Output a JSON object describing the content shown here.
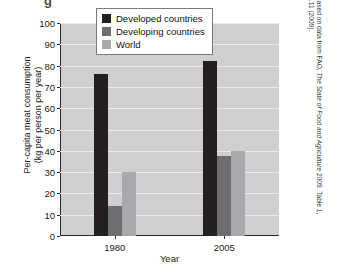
{
  "figure": {
    "top_glyph": "g"
  },
  "axes": {
    "ylabel_line1": "Per-capita meat consumption",
    "ylabel_line2": "(kg per person per year)",
    "xlabel": "Year"
  },
  "legend": {
    "items": [
      {
        "label": "Developed countries",
        "color": "#231f20"
      },
      {
        "label": "Developing countries",
        "color": "#6d6e70"
      },
      {
        "label": "World",
        "color": "#a7a9ac"
      }
    ]
  },
  "credit": {
    "prefix": "Based on data from FAO, ",
    "title": "The State of Food and Agriculture",
    "suffix": " 2009. Table 1, p.11 (2009)."
  },
  "chart_data": {
    "type": "bar",
    "title": "",
    "xlabel": "Year",
    "ylabel": "Per-capita meat consumption (kg per person per year)",
    "categories": [
      "1980",
      "2005"
    ],
    "series": [
      {
        "name": "Developed countries",
        "color": "#231f20",
        "values": [
          76,
          82
        ]
      },
      {
        "name": "Developing countries",
        "color": "#6d6e70",
        "values": [
          14,
          37.5
        ]
      },
      {
        "name": "World",
        "color": "#a7a9ac",
        "values": [
          30,
          40
        ]
      }
    ],
    "ylim": [
      0,
      100
    ],
    "yticks": [
      0,
      10,
      20,
      30,
      40,
      50,
      60,
      70,
      80,
      90,
      100
    ],
    "ytick_labels": [
      "0",
      "10",
      "20",
      "30",
      "40",
      "50",
      "60",
      "70",
      "80",
      "90",
      "100"
    ],
    "grid": true,
    "legend_position": "top-center",
    "plot_background": "#cfcfcf",
    "gridline_color": "#eceae7"
  }
}
